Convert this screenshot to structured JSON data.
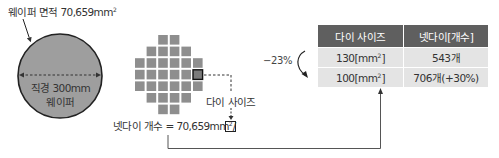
{
  "wafer": {
    "area_label": "웨이퍼 면적 70,659mm",
    "area_sup": "2",
    "diameter_label": "직경 300mm",
    "name_label": "웨이퍼",
    "fill_color": "#9e9e9e"
  },
  "die_grid": {
    "rows": [
      {
        "start_col": 2,
        "count": 2
      },
      {
        "start_col": 1,
        "count": 4
      },
      {
        "start_col": 0,
        "count": 6
      },
      {
        "start_col": 0,
        "count": 6,
        "highlight_col": 5
      },
      {
        "start_col": 0,
        "count": 6
      },
      {
        "start_col": 1,
        "count": 4
      },
      {
        "start_col": 2,
        "count": 2
      }
    ],
    "die_color": "#8e8e8e",
    "die_size_label": "다이 사이즈"
  },
  "formula": {
    "text": "넷다이 개수 = 70,659mm",
    "sup": "2",
    "suffix": "/"
  },
  "change": {
    "percent_label": "−23%"
  },
  "table": {
    "headers": [
      "다이 사이즈",
      "넷다이[개수]"
    ],
    "rows": [
      {
        "size": "130[mm",
        "size_sup": "2",
        "size_close": "]",
        "count": "543개"
      },
      {
        "size": "100[mm",
        "size_sup": "2",
        "size_close": "]",
        "count": "706개(+30%)"
      }
    ],
    "header_color": "#5f5f5f",
    "row_color": "#e4e4e4"
  }
}
